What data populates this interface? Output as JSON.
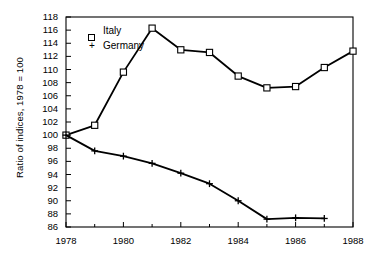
{
  "chart_data": {
    "type": "line",
    "title": "",
    "xlabel": "",
    "ylabel": "Ratio of indices, 1978 = 100",
    "xlim": [
      1978,
      1988
    ],
    "ylim": [
      86,
      118
    ],
    "grid": false,
    "legend_position": "top-left",
    "x_major_ticks": [
      1978,
      1980,
      1982,
      1984,
      1986,
      1988
    ],
    "x_minor_ticks": [
      1979,
      1981,
      1983,
      1985,
      1987
    ],
    "x_tick_labels": [
      "1978",
      "1980",
      "1982",
      "1984",
      "1986",
      "1988"
    ],
    "y_ticks": [
      86,
      88,
      90,
      92,
      94,
      96,
      98,
      100,
      102,
      104,
      106,
      108,
      110,
      112,
      114,
      116,
      118
    ],
    "y_tick_labels": [
      "86",
      "88",
      "90",
      "92",
      "94",
      "96",
      "98",
      "100",
      "102",
      "104",
      "106",
      "108",
      "110",
      "112",
      "114",
      "116",
      "118"
    ],
    "series": [
      {
        "name": "Italy",
        "marker": "open-square",
        "x": [
          1978,
          1979,
          1980,
          1981,
          1982,
          1983,
          1984,
          1985,
          1986,
          1987,
          1988
        ],
        "values": [
          100.0,
          101.5,
          109.6,
          116.3,
          113.0,
          112.6,
          109.0,
          107.2,
          107.4,
          110.3,
          112.8
        ]
      },
      {
        "name": "Germany",
        "marker": "plus",
        "x": [
          1978,
          1979,
          1980,
          1981,
          1982,
          1983,
          1984,
          1985,
          1986,
          1987
        ],
        "values": [
          100.0,
          97.6,
          96.8,
          95.7,
          94.2,
          92.6,
          90.0,
          87.2,
          87.4,
          87.3
        ]
      }
    ]
  },
  "legend": {
    "items": [
      {
        "marker": "square",
        "label": "Italy"
      },
      {
        "marker": "plus",
        "label": "Germany"
      }
    ]
  }
}
